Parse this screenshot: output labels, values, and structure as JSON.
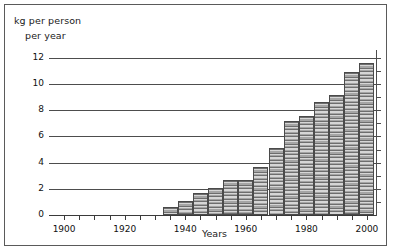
{
  "chart_data": {
    "type": "bar",
    "title": "",
    "ylabel": "kg per person per year",
    "ylabel_line1": "kg per person",
    "ylabel_line2": "per year",
    "xlabel": "Years",
    "ylim": [
      0,
      12.6
    ],
    "xlim": [
      1895,
      2003
    ],
    "grid": true,
    "legend": null,
    "ytick_labels": [
      "0",
      "2",
      "4",
      "6",
      "8",
      "10",
      "12"
    ],
    "ytick_values": [
      0,
      2,
      4,
      6,
      8,
      10,
      12
    ],
    "xtick_labels": [
      "1900",
      "1920",
      "1940",
      "1960",
      "1980",
      "2000"
    ],
    "xtick_values": [
      1900,
      1920,
      1940,
      1960,
      1980,
      2000
    ],
    "xminor_step": 5,
    "categories": [
      1935,
      1940,
      1945,
      1950,
      1955,
      1960,
      1965,
      1970,
      1975,
      1980,
      1985,
      1990,
      1995,
      2000
    ],
    "values": [
      0.6,
      1.1,
      1.65,
      2.1,
      2.65,
      2.65,
      3.7,
      5.15,
      7.15,
      7.6,
      8.65,
      9.2,
      10.9,
      11.6
    ],
    "bar_color": "#9a9a9a",
    "bar_edge_color": "#4a4a4a",
    "grid_color": "#4d4d4d",
    "frame_color": "#5a5a5a"
  }
}
